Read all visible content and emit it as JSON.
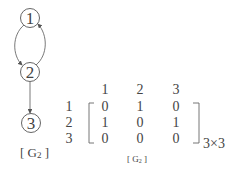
{
  "graph": {
    "nodes": [
      {
        "id": "1",
        "label": "1",
        "cx": 30,
        "cy": 18
      },
      {
        "id": "2",
        "label": "2",
        "cx": 30,
        "cy": 72
      },
      {
        "id": "3",
        "label": "3",
        "cx": 31,
        "cy": 123
      }
    ],
    "edges": [
      {
        "from": "2",
        "to": "1"
      },
      {
        "from": "1",
        "to": "2"
      },
      {
        "from": "2",
        "to": "3"
      }
    ],
    "caption": "[ G",
    "caption_sub": "2",
    "caption_end": " ]"
  },
  "matrix": {
    "col_headers": [
      "1",
      "2",
      "3"
    ],
    "row_headers": [
      "1",
      "2",
      "3"
    ],
    "rows": [
      [
        "0",
        "1",
        "0"
      ],
      [
        "1",
        "0",
        "1"
      ],
      [
        "0",
        "0",
        "0"
      ]
    ],
    "size_label": "3×3",
    "caption": "[ G",
    "caption_sub": "2",
    "caption_end": " ]"
  },
  "colors": {
    "stroke": "#555555",
    "text": "#444444"
  }
}
